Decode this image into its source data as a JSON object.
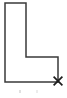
{
  "figure": {
    "background_color": "#ffffff",
    "canvas": {
      "width": 67,
      "height": 98
    }
  },
  "shape": {
    "name": "l-shaped-polygon",
    "type": "polygon",
    "stroke_color": "#3a3a3a",
    "stroke_width": 1.5,
    "fill": "none",
    "points": "5,3 26,3 26,57 58,57 58,82 5,82",
    "vertices": [
      {
        "label": "top-left",
        "x": 5,
        "y": 3
      },
      {
        "label": "top-right",
        "x": 26,
        "y": 3
      },
      {
        "label": "inner-corner",
        "x": 26,
        "y": 57
      },
      {
        "label": "right-step",
        "x": 58,
        "y": 57
      },
      {
        "label": "bottom-right",
        "x": 58,
        "y": 82
      },
      {
        "label": "bottom-left",
        "x": 5,
        "y": 82
      }
    ]
  },
  "marker": {
    "name": "x-marker",
    "glyph": "x",
    "color": "#1c1c1c",
    "x": 58,
    "y": 81,
    "size": 11,
    "description": "cross mark at bottom-right vertex"
  },
  "artifacts": [
    {
      "name": "speck-left",
      "x": 19,
      "y": 90,
      "color": "#c9c9c9"
    },
    {
      "name": "speck-right",
      "x": 36,
      "y": 90,
      "color": "#c9c9c9"
    }
  ]
}
